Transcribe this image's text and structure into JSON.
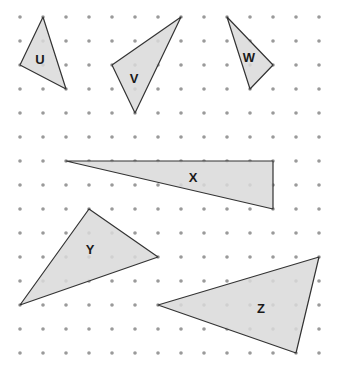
{
  "grid": {
    "x0": 20,
    "dx": 23,
    "cols": 14,
    "y0": 17,
    "dy": 24,
    "rows": 15,
    "dot_color": "#9a9a9a",
    "dot_radius": 1.8
  },
  "style": {
    "fill": "#d9d9d9",
    "stroke": "#333333"
  },
  "triangles": [
    {
      "label": "U",
      "points": [
        [
          43,
          17
        ],
        [
          20,
          65
        ],
        [
          66,
          89
        ]
      ],
      "label_pos": [
        40,
        61
      ]
    },
    {
      "label": "V",
      "points": [
        [
          181,
          17
        ],
        [
          112,
          65
        ],
        [
          135,
          113
        ]
      ],
      "label_pos": [
        134,
        80
      ]
    },
    {
      "label": "W",
      "points": [
        [
          227,
          17
        ],
        [
          273,
          65
        ],
        [
          250,
          89
        ]
      ],
      "label_pos": [
        249,
        59
      ]
    },
    {
      "label": "X",
      "points": [
        [
          66,
          161
        ],
        [
          273,
          161
        ],
        [
          273,
          209
        ]
      ],
      "label_pos": [
        193,
        179
      ]
    },
    {
      "label": "Y",
      "points": [
        [
          89,
          209
        ],
        [
          158,
          257
        ],
        [
          20,
          305
        ]
      ],
      "label_pos": [
        90,
        251
      ]
    },
    {
      "label": "Z",
      "points": [
        [
          158,
          305
        ],
        [
          319,
          257
        ],
        [
          296,
          353
        ]
      ],
      "label_pos": [
        261,
        310
      ]
    }
  ]
}
